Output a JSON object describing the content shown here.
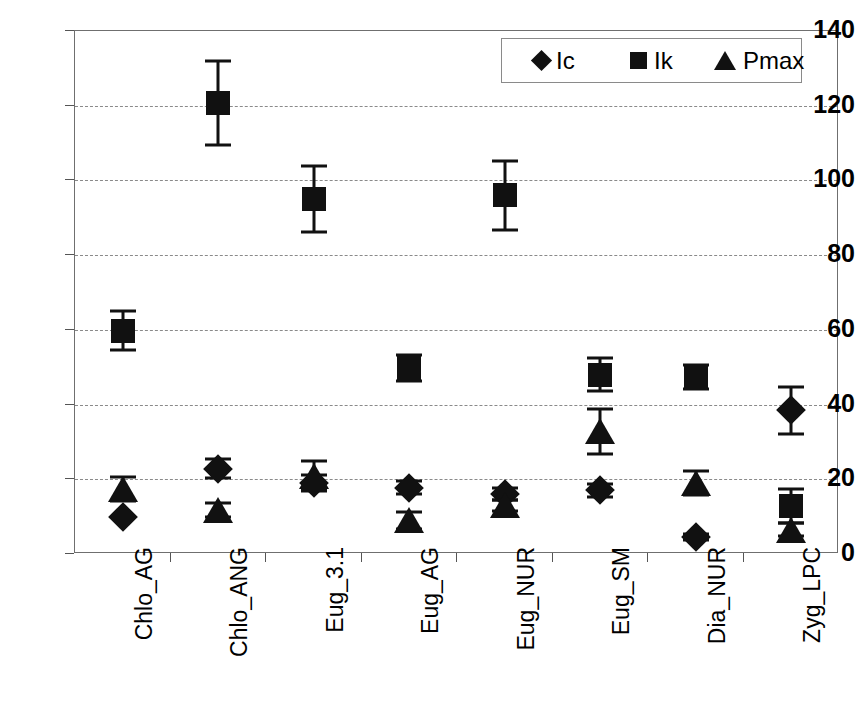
{
  "chart_data": {
    "type": "scatter",
    "title": "",
    "xlabel": "",
    "ylabel": "",
    "ylim": [
      0,
      140
    ],
    "ytick_values": [
      0,
      20,
      40,
      60,
      80,
      100,
      120,
      140
    ],
    "ytick_labels": [
      "0",
      "20",
      "40",
      "60",
      "80",
      "100",
      "120",
      "140"
    ],
    "grid": true,
    "grid_axis": "y",
    "grid_style": "dashed",
    "legend_position": "top-right",
    "categories": [
      "Chlo_AG",
      "Chlo_ANG",
      "Eug_3.1",
      "Eug_AG",
      "Eug_NUR",
      "Eug_SM",
      "Dia_NUR",
      "Zyg_LPC"
    ],
    "series": [
      {
        "name": "Ic",
        "marker": "diamond",
        "color": "#111111",
        "values": [
          10,
          22.8,
          19,
          17.8,
          16,
          17,
          4.5,
          38.5
        ],
        "errors": [
          0,
          2.5,
          2.2,
          1.8,
          1.6,
          1.7,
          0.8,
          6.3
        ]
      },
      {
        "name": "Ik",
        "marker": "square",
        "color": "#111111",
        "values": [
          59.8,
          120.8,
          95,
          49.8,
          96,
          48,
          47.3,
          12.8
        ],
        "errors": [
          5.2,
          11.2,
          8.8,
          3.5,
          9.3,
          4.5,
          3.2,
          4.5
        ]
      },
      {
        "name": "Pmax",
        "marker": "triangle",
        "color": "#111111",
        "values": [
          17.5,
          11.8,
          21,
          9,
          13,
          32.8,
          19,
          6.5
        ],
        "errors": [
          3.2,
          1.8,
          4.0,
          2.2,
          1.5,
          6.0,
          3.2,
          1.8
        ]
      }
    ]
  },
  "legend": {
    "entries": [
      {
        "label": "Ic",
        "marker": "diamond"
      },
      {
        "label": "Ik",
        "marker": "square"
      },
      {
        "label": "Pmax",
        "marker": "triangle"
      }
    ]
  }
}
